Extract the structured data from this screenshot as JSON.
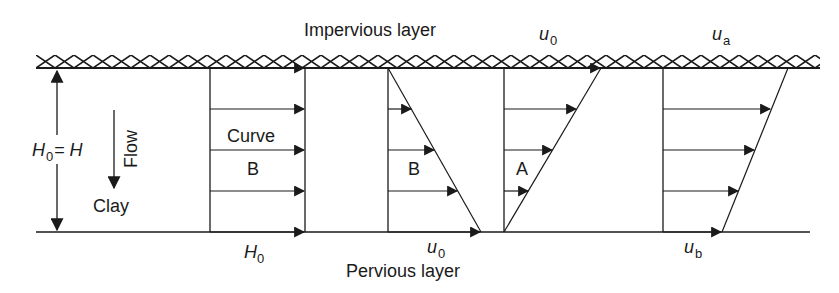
{
  "diagram": {
    "type": "consolidation velocity profiles",
    "layers": {
      "top": "Impervious layer",
      "bottom": "Pervious layer",
      "soil": "Clay"
    },
    "dimension": {
      "label_main": "H",
      "label_sub": "0",
      "label_eq": "= H",
      "direction": "vertical double arrow"
    },
    "flow": {
      "label": "Flow",
      "direction": "down"
    },
    "panels": [
      {
        "id": "panel-1",
        "labels": [
          "Curve",
          "B"
        ],
        "bottom_label_main": "H",
        "bottom_label_sub": "0",
        "profile": "uniform"
      },
      {
        "id": "panel-2",
        "labels": [
          "B"
        ],
        "bottom_label_main": "u",
        "bottom_label_sub": "0",
        "profile": "triangular increasing downward"
      },
      {
        "id": "panel-3",
        "labels": [
          "A"
        ],
        "top_label_main": "u",
        "top_label_sub": "0",
        "profile": "triangular increasing upward"
      },
      {
        "id": "panel-4",
        "labels": [],
        "top_label_main": "u",
        "top_label_sub": "a",
        "bottom_label_main": "u",
        "bottom_label_sub": "b",
        "profile": "trapezoidal"
      }
    ],
    "colors": {
      "ink": "#1a1a1a",
      "background": "#ffffff"
    }
  }
}
